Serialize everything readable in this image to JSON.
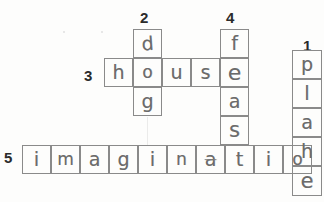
{
  "worksheet": {
    "type": "handwritten-crossword-puzzle",
    "ink_color": "#6b6b6b",
    "grid_line_color": "#8a8a8a",
    "number_color": "#2b2b2b",
    "cell_size": 29
  },
  "clue_numbers": [
    {
      "label": "1",
      "x": 303,
      "y": 38
    },
    {
      "label": "2",
      "x": 140,
      "y": 10
    },
    {
      "label": "4",
      "x": 226,
      "y": 10
    },
    {
      "label": "3",
      "x": 84,
      "y": 68
    },
    {
      "label": "5",
      "x": 4,
      "y": 150
    }
  ],
  "entries": [
    {
      "number": "1",
      "direction": "down",
      "answer": "plahe",
      "letters": [
        "p",
        "l",
        "a",
        "h",
        "e"
      ]
    },
    {
      "number": "2",
      "direction": "down",
      "answer": "dog",
      "letters": [
        "d",
        "o",
        "g"
      ]
    },
    {
      "number": "3",
      "direction": "across",
      "answer": "house",
      "letters": [
        "h",
        "o",
        "u",
        "s",
        "e"
      ]
    },
    {
      "number": "4",
      "direction": "down",
      "answer": "feast",
      "letters": [
        "f",
        "e",
        "a",
        "s",
        "t"
      ]
    },
    {
      "number": "5",
      "direction": "across",
      "answer": "imaginatioh",
      "letters": [
        "i",
        "m",
        "a",
        "g",
        "i",
        "n",
        "a",
        "t",
        "i",
        "o",
        "h"
      ]
    }
  ],
  "cells": [
    {
      "id": "c2-1",
      "letter": "d",
      "x": 133,
      "y": 29,
      "w": 29,
      "h": 29,
      "rot": -4
    },
    {
      "id": "c2-2",
      "letter": "o",
      "x": 133,
      "y": 58,
      "w": 29,
      "h": 29,
      "rot": 0
    },
    {
      "id": "c2-3",
      "letter": "g",
      "x": 133,
      "y": 87,
      "w": 29,
      "h": 29,
      "rot": 0
    },
    {
      "id": "c3-1",
      "letter": "h",
      "x": 104,
      "y": 58,
      "w": 29,
      "h": 29,
      "rot": 0
    },
    {
      "id": "c3-3",
      "letter": "u",
      "x": 162,
      "y": 58,
      "w": 29,
      "h": 29,
      "rot": 0
    },
    {
      "id": "c3-4",
      "letter": "s",
      "x": 191,
      "y": 58,
      "w": 29,
      "h": 29,
      "rot": 0
    },
    {
      "id": "c4-1",
      "letter": "f",
      "x": 220,
      "y": 29,
      "w": 29,
      "h": 29,
      "rot": 0
    },
    {
      "id": "c4-2",
      "letter": "e",
      "x": 220,
      "y": 58,
      "w": 29,
      "h": 29,
      "rot": 0
    },
    {
      "id": "c4-3",
      "letter": "a",
      "x": 220,
      "y": 87,
      "w": 29,
      "h": 29,
      "rot": 0
    },
    {
      "id": "c4-4",
      "letter": "s",
      "x": 220,
      "y": 116,
      "w": 29,
      "h": 29,
      "rot": 0
    },
    {
      "id": "c1-1",
      "letter": "p",
      "x": 292,
      "y": 50,
      "w": 30,
      "h": 29,
      "rot": 0
    },
    {
      "id": "c1-2",
      "letter": "l",
      "x": 292,
      "y": 79,
      "w": 30,
      "h": 29,
      "rot": 0
    },
    {
      "id": "c1-3",
      "letter": "a",
      "x": 292,
      "y": 108,
      "w": 30,
      "h": 29,
      "rot": 0
    },
    {
      "id": "c1-5",
      "letter": "e",
      "x": 292,
      "y": 166,
      "w": 30,
      "h": 30,
      "rot": 0
    },
    {
      "id": "c5-1",
      "letter": "i",
      "x": 22,
      "y": 145,
      "w": 29,
      "h": 29,
      "rot": 0
    },
    {
      "id": "c5-2",
      "letter": "m",
      "x": 51,
      "y": 145,
      "w": 29,
      "h": 29,
      "rot": 0
    },
    {
      "id": "c5-3",
      "letter": "a",
      "x": 80,
      "y": 145,
      "w": 29,
      "h": 29,
      "rot": 0
    },
    {
      "id": "c5-4",
      "letter": "g",
      "x": 109,
      "y": 145,
      "w": 29,
      "h": 29,
      "rot": 0
    },
    {
      "id": "c5-5",
      "letter": "i",
      "x": 138,
      "y": 145,
      "w": 29,
      "h": 29,
      "rot": 0
    },
    {
      "id": "c5-6",
      "letter": "n",
      "x": 167,
      "y": 145,
      "w": 29,
      "h": 29,
      "rot": 0
    },
    {
      "id": "c5-7",
      "letter": "a",
      "x": 196,
      "y": 145,
      "w": 29,
      "h": 29,
      "rot": 0
    },
    {
      "id": "c5-8",
      "letter": "t",
      "x": 225,
      "y": 145,
      "w": 29,
      "h": 29,
      "rot": 0
    },
    {
      "id": "c5-9",
      "letter": "i",
      "x": 254,
      "y": 145,
      "w": 29,
      "h": 29,
      "rot": 0
    },
    {
      "id": "c5-10",
      "letter": "o",
      "x": 283,
      "y": 145,
      "w": 29,
      "h": 29,
      "rot": 0
    },
    {
      "id": "c5-11",
      "letter": "h",
      "x": 292,
      "y": 137,
      "w": 30,
      "h": 29,
      "rot": 0
    }
  ]
}
